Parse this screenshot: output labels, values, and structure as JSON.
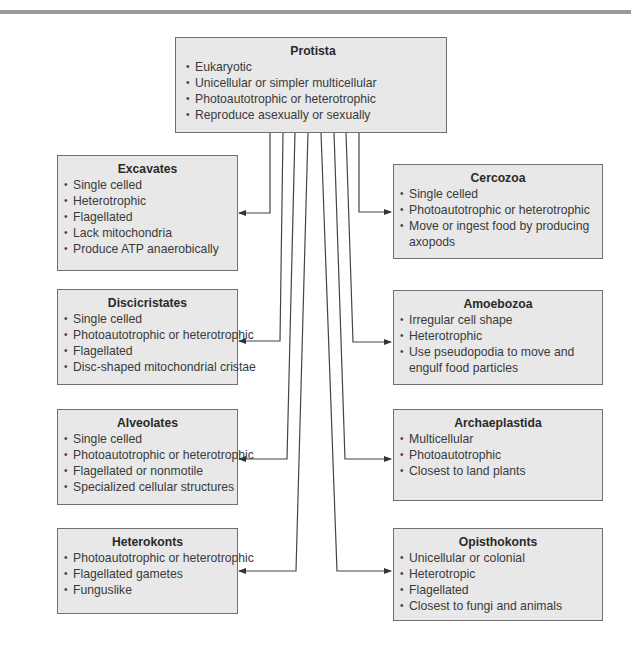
{
  "root": {
    "title": "Protista",
    "items": [
      "Eukaryotic",
      "Unicellular or simpler multicellular",
      "Photoautotrophic or heterotrophic",
      "Reproduce asexually or sexually"
    ]
  },
  "left_groups": [
    {
      "title": "Excavates",
      "items": [
        "Single celled",
        "Heterotrophic",
        "Flagellated",
        "Lack mitochondria",
        "Produce ATP anaerobically"
      ]
    },
    {
      "title": "Discicristates",
      "items": [
        "Single celled",
        "Photoautotrophic or heterotrophic",
        "Flagellated",
        "Disc-shaped mitochondrial cristae"
      ]
    },
    {
      "title": "Alveolates",
      "items": [
        "Single celled",
        "Photoautotrophic or heterotrophic",
        "Flagellated or nonmotile",
        "Specialized cellular structures"
      ]
    },
    {
      "title": "Heterokonts",
      "items": [
        "Photoautotrophic or heterotrophic",
        "Flagellated gametes",
        "Funguslike"
      ]
    }
  ],
  "right_groups": [
    {
      "title": "Cercozoa",
      "items": [
        "Single celled",
        "Photoautotrophic or heterotrophic",
        "Move or ingest food by producing axopods"
      ]
    },
    {
      "title": "Amoebozoa",
      "items": [
        "Irregular cell shape",
        "Heterotrophic",
        "Use pseudopodia to move and engulf food particles"
      ]
    },
    {
      "title": "Archaeplastida",
      "items": [
        "Multicellular",
        "Photoautotrophic",
        "Closest to land plants"
      ]
    },
    {
      "title": "Opisthokonts",
      "items": [
        "Unicellular or colonial",
        "Heterotropic",
        "Flagellated",
        "Closest to fungi and animals"
      ]
    }
  ],
  "colors": {
    "box_fill": "#e8e8e8",
    "box_border": "#707070",
    "connector": "#444444",
    "top_rule": "#9a9a9a"
  }
}
